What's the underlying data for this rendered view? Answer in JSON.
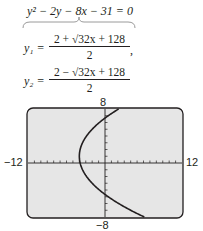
{
  "equation": {
    "original": "y² − 2y − 8x − 31 = 0",
    "y1_label": "y₁ =",
    "y1_numerator": "2 + √32x + 128",
    "y1_denominator": "2",
    "y1_trailing": ",",
    "y2_label": "y₂ =",
    "y2_numerator": "2 − √32x + 128",
    "y2_denominator": "2"
  },
  "chart_data": {
    "type": "line",
    "title": "y² − 2y − 8x − 31 = 0",
    "xlabel": "",
    "ylabel": "",
    "xlim": [
      -12,
      12
    ],
    "ylim": [
      -8,
      8
    ],
    "x_tick_spacing": 1,
    "y_tick_spacing": 1,
    "tick_labels": {
      "xmin": "−12",
      "xmax": "12",
      "ymin": "−8",
      "ymax": "8"
    },
    "grid": false,
    "series": [
      {
        "name": "y1 = (2 + sqrt(32x + 128)) / 2",
        "x": [
          -4,
          -3.875,
          -3.5,
          -3,
          -2,
          -1,
          0,
          1,
          2,
          3,
          3.5
        ],
        "values": [
          1,
          2,
          3.45,
          4.46,
          5.9,
          7.0,
          7.93,
          8.0,
          null,
          null,
          null
        ]
      },
      {
        "name": "y2 = (2 - sqrt(32x + 128)) / 2",
        "x": [
          -4,
          -3.875,
          -3.5,
          -3,
          -2,
          -1,
          0,
          1,
          2,
          3,
          4
        ],
        "values": [
          1,
          0,
          -1.45,
          -2.46,
          -3.9,
          -5.0,
          -5.93,
          -6.77,
          -7.49,
          -8.0,
          null
        ]
      }
    ],
    "screen_background": "#e6e6e6",
    "curve_color": "#231f20"
  }
}
